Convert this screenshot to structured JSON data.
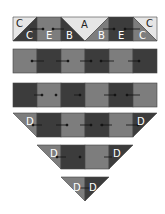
{
  "diagram": {
    "title": "",
    "colors": {
      "dark": "#3c3c3c",
      "medium": "#7d7d7d",
      "light": "#e6e6e6",
      "outline": "#444444"
    },
    "rows": [
      {
        "name": "row-1",
        "labels": {
          "c_left_top": "C",
          "c_left_bottom": "C",
          "e_left": "E",
          "b_left": "B",
          "a": "A",
          "b_right": "B",
          "e_right": "E",
          "c_right_top": "C",
          "c_right_bottom": "C"
        }
      },
      {
        "name": "row-2",
        "pattern": [
          "medium",
          "dark",
          "medium",
          "dark",
          "medium",
          "dark"
        ]
      },
      {
        "name": "row-3",
        "pattern": [
          "dark",
          "medium",
          "dark",
          "medium",
          "dark",
          "medium"
        ]
      },
      {
        "name": "row-4",
        "labels": {
          "d_left": "D",
          "d_right": "D"
        },
        "pattern": [
          "medium-triangle",
          "dark",
          "medium",
          "dark",
          "medium",
          "dark-triangle"
        ]
      },
      {
        "name": "row-5",
        "labels": {
          "d_left": "D",
          "d_right": "D"
        },
        "pattern": [
          "medium-triangle",
          "dark",
          "medium",
          "dark-triangle"
        ]
      },
      {
        "name": "row-6",
        "labels": {
          "d_left": "D",
          "d_right": "D"
        },
        "pattern": [
          "medium-half",
          "dark-half"
        ]
      }
    ]
  }
}
